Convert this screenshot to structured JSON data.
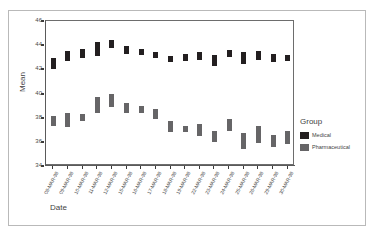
{
  "chart_data": {
    "type": "bar",
    "title": "",
    "xlabel": "Date",
    "ylabel": "Mean",
    "ylim": [
      34,
      46
    ],
    "yticks": [
      34,
      36,
      38,
      40,
      42,
      44,
      46
    ],
    "grid": false,
    "legend_position": "right",
    "legend_title": "Group",
    "categories": [
      "08-MAR-98",
      "09-MAR-98",
      "10-MAR-98",
      "11-MAR-98",
      "12-MAR-98",
      "15-MAR-98",
      "16-MAR-98",
      "17-MAR-98",
      "18-MAR-98",
      "19-MAR-98",
      "22-MAR-98",
      "23-MAR-98",
      "24-MAR-98",
      "25-MAR-98",
      "26-MAR-98",
      "29-MAR-98",
      "30-MAR-98"
    ],
    "series": [
      {
        "name": "Medical",
        "color": "#231f20",
        "low": [
          42.0,
          42.7,
          42.9,
          43.1,
          43.8,
          43.3,
          43.2,
          42.9,
          42.6,
          42.7,
          42.8,
          42.3,
          43.0,
          42.4,
          42.8,
          42.6,
          42.7
        ],
        "high": [
          42.9,
          43.5,
          43.7,
          44.3,
          44.4,
          43.9,
          43.7,
          43.4,
          43.1,
          43.3,
          43.4,
          43.2,
          43.6,
          43.4,
          43.5,
          43.3,
          43.2
        ],
        "values": [
          42.45,
          43.1,
          43.3,
          43.7,
          44.1,
          43.6,
          43.45,
          43.15,
          42.85,
          43.0,
          43.1,
          42.75,
          43.3,
          42.9,
          43.15,
          42.95,
          42.95
        ]
      },
      {
        "name": "Pharmaceutical",
        "color": "#666567",
        "low": [
          37.3,
          37.2,
          37.7,
          38.4,
          38.9,
          38.4,
          38.4,
          37.9,
          36.8,
          36.8,
          36.5,
          36.0,
          36.9,
          35.4,
          35.9,
          35.6,
          35.8
        ],
        "high": [
          38.1,
          38.4,
          38.3,
          39.7,
          40.0,
          39.2,
          39.0,
          38.7,
          37.7,
          37.3,
          37.5,
          36.9,
          37.9,
          36.7,
          37.3,
          36.6,
          36.9
        ],
        "values": [
          37.7,
          37.8,
          38.0,
          39.05,
          39.45,
          38.8,
          38.7,
          38.3,
          37.25,
          37.05,
          37.0,
          36.45,
          37.4,
          36.05,
          36.6,
          36.1,
          36.35
        ]
      }
    ]
  },
  "legend": {
    "title": "Group",
    "entries": [
      {
        "label": "Medical",
        "color": "#231f20"
      },
      {
        "label": "Pharmaceutical",
        "color": "#666567"
      }
    ]
  },
  "axes": {
    "y_title": "Mean",
    "x_title": "Date"
  }
}
